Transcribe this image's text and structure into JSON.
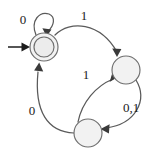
{
  "diagram": {
    "type": "state-machine",
    "background_color": "#ffffff",
    "stroke_color": "#5a5a5a",
    "node_fill_color": "#f2f2f2",
    "label_color": "#1a1a1a",
    "alphabet": [
      "0",
      "1"
    ],
    "states": [
      {
        "id": "q0",
        "label": "",
        "cx": 44,
        "cy": 47,
        "r": 14,
        "accepting": true,
        "inner_r": 10,
        "start": true
      },
      {
        "id": "q1",
        "label": "",
        "cx": 126,
        "cy": 70,
        "r": 14,
        "accepting": false,
        "start": false
      },
      {
        "id": "q2",
        "label": "",
        "cx": 88,
        "cy": 133,
        "r": 14,
        "accepting": false,
        "start": false
      }
    ],
    "transitions": [
      {
        "id": "t-q0-q0",
        "from": "q0",
        "to": "q0",
        "symbol": "0",
        "label_x": 23,
        "label_y": 21,
        "kind": "self-loop"
      },
      {
        "id": "t-q0-q1",
        "from": "q0",
        "to": "q1",
        "symbol": "1",
        "label_x": 84,
        "label_y": 17,
        "kind": "arc-top"
      },
      {
        "id": "t-q1-q2",
        "from": "q1",
        "to": "q2",
        "symbol": "0,1",
        "label_x": 131,
        "label_y": 109,
        "kind": "arc-right"
      },
      {
        "id": "t-q2-q1",
        "from": "q2",
        "to": "q1",
        "symbol": "1",
        "label_x": 86,
        "label_y": 76,
        "kind": "arc-inner"
      },
      {
        "id": "t-q2-q0",
        "from": "q2",
        "to": "q0",
        "symbol": "0",
        "label_x": 32,
        "label_y": 112,
        "kind": "arc-left"
      }
    ],
    "start_marker": {
      "id": "start-arrow",
      "label": "",
      "x1": 8,
      "y1": 47,
      "x2": 28,
      "y2": 47
    }
  }
}
